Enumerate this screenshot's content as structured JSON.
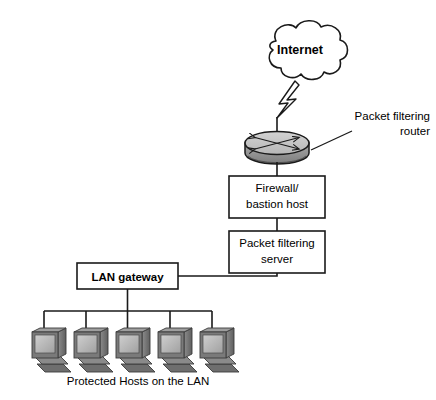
{
  "diagram": {
    "background_color": "#ffffff",
    "line_color": "#1a1a1a",
    "device_fill_light": "#c9c9c9",
    "device_fill_mid": "#9a9a9a",
    "device_fill_dark": "#6e6e6e",
    "screen_fill": "#b4b4b4"
  },
  "cloud": {
    "label": "Internet",
    "name": "internet-cloud"
  },
  "link_wireless": {
    "name": "lightning-bolt-icon",
    "label": ""
  },
  "router": {
    "name": "packet-filtering-router",
    "callout_line1": "Packet filtering",
    "callout_line2": "router"
  },
  "boxes": [
    {
      "name": "firewall-bastion-host-box",
      "line1": "Firewall/",
      "line2": "bastion host"
    },
    {
      "name": "packet-filtering-server-box",
      "line1": "Packet filtering",
      "line2": "server"
    }
  ],
  "gateway": {
    "name": "lan-gateway-box",
    "label": "LAN gateway"
  },
  "hosts": {
    "name": "protected-hosts-group",
    "caption": "Protected Hosts on the LAN",
    "count": 5,
    "items": [
      {
        "name": "host-computer-1"
      },
      {
        "name": "host-computer-2"
      },
      {
        "name": "host-computer-3"
      },
      {
        "name": "host-computer-4"
      },
      {
        "name": "host-computer-5"
      }
    ]
  }
}
